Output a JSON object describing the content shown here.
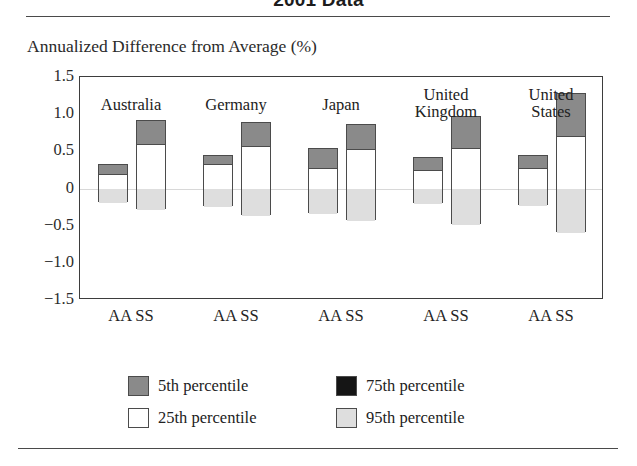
{
  "figure": {
    "title": "2001 Data",
    "axis_caption": "Annualized Difference from Average (%)"
  },
  "colors": {
    "p5": "#8a8a8a",
    "p25": "#ffffff",
    "p75": "#151515",
    "p95": "#dedede",
    "outline": "#4b4b4b",
    "frame": "#3d3d3d",
    "rule": "#4a4a4a"
  },
  "legend": {
    "position": "below-plot",
    "items": [
      {
        "label": "5th percentile",
        "swatch": "p5"
      },
      {
        "label": "75th percentile",
        "swatch": "p75"
      },
      {
        "label": "25th percentile",
        "swatch": "p25"
      },
      {
        "label": "95th percentile",
        "swatch": "p95"
      }
    ]
  },
  "axis": {
    "y_ticks": [
      "1.5",
      "1.0",
      "0.5",
      "0",
      "−0.5",
      "−1.0",
      "−1.5"
    ],
    "y_values": [
      1.5,
      1.0,
      0.5,
      0,
      -0.5,
      -1.0,
      -1.5
    ],
    "x_ticks": [
      "AA  SS",
      "AA  SS",
      "AA  SS",
      "AA  SS",
      "AA  SS"
    ]
  },
  "chart_data": {
    "type": "bar",
    "subtype": "stacked-percentile-range",
    "title": "2001 Data",
    "xlabel": "",
    "ylabel": "Annualized Difference from Average (%)",
    "ylim": [
      -1.5,
      1.5
    ],
    "yticks": [
      1.5,
      1.0,
      0.5,
      0,
      -0.5,
      -1.0,
      -1.5
    ],
    "grid": false,
    "zero_line": true,
    "legend_entries": [
      "5th percentile",
      "25th percentile",
      "75th percentile",
      "95th percentile"
    ],
    "categories": [
      "Australia",
      "Germany",
      "Japan",
      "United Kingdom",
      "United States"
    ],
    "subgroups": [
      "AA",
      "SS"
    ],
    "note": "Each bar spans from the 5th percentile (top) down to the 95th percentile (bottom); internal boundaries mark the 25th and 75th percentiles.",
    "bars": [
      {
        "group": "Australia",
        "group_label": "Australia",
        "sub": "AA",
        "p5": 0.33,
        "p25": 0.2,
        "p75": -0.05,
        "p95": -0.18
      },
      {
        "group": "Australia",
        "group_label": "Australia",
        "sub": "SS",
        "p5": 0.92,
        "p25": 0.6,
        "p75": -0.05,
        "p95": -0.28
      },
      {
        "group": "Germany",
        "group_label": "Germany",
        "sub": "AA",
        "p5": 0.45,
        "p25": 0.33,
        "p75": -0.1,
        "p95": -0.23
      },
      {
        "group": "Germany",
        "group_label": "Germany",
        "sub": "SS",
        "p5": 0.9,
        "p25": 0.57,
        "p75": -0.12,
        "p95": -0.35
      },
      {
        "group": "Japan",
        "group_label": "Japan",
        "sub": "AA",
        "p5": 0.55,
        "p25": 0.28,
        "p75": -0.07,
        "p95": -0.33
      },
      {
        "group": "Japan",
        "group_label": "Japan",
        "sub": "SS",
        "p5": 0.87,
        "p25": 0.53,
        "p75": -0.12,
        "p95": -0.42
      },
      {
        "group": "United Kingdom",
        "group_label": "United\nKingdom",
        "sub": "AA",
        "p5": 0.42,
        "p25": 0.25,
        "p75": -0.05,
        "p95": -0.2
      },
      {
        "group": "United Kingdom",
        "group_label": "United\nKingdom",
        "sub": "SS",
        "p5": 0.98,
        "p25": 0.55,
        "p75": -0.1,
        "p95": -0.48
      },
      {
        "group": "United States",
        "group_label": "United\nStates",
        "sub": "AA",
        "p5": 0.45,
        "p25": 0.28,
        "p75": -0.07,
        "p95": -0.22
      },
      {
        "group": "United States",
        "group_label": "United\nStates",
        "sub": "SS",
        "p5": 1.28,
        "p25": 0.7,
        "p75": -0.12,
        "p95": -0.58
      }
    ]
  }
}
